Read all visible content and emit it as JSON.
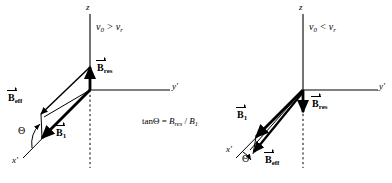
{
  "figure": {
    "background": "#ffffff",
    "stroke_color": "#000000"
  },
  "panels": [
    {
      "id": "left",
      "condition": "ν0 > νr",
      "condition_parts": {
        "nu": "ν",
        "sub0": "0",
        "relation": ">",
        "nu2": "ν",
        "subr": "r"
      },
      "axes": [
        {
          "name": "z-axis",
          "label": "z",
          "direction": "up"
        },
        {
          "name": "y-prime-axis",
          "label": "y'",
          "direction": "right"
        },
        {
          "name": "x-prime-axis",
          "label": "x'",
          "direction": "lower-left"
        }
      ],
      "vectors": [
        {
          "name": "B_res",
          "label": "B",
          "sub": "res",
          "direction": "up-along-z"
        },
        {
          "name": "B_1",
          "label": "B",
          "sub": "1",
          "direction": "lower-left-along-x-prime"
        },
        {
          "name": "B_eff",
          "label": "B",
          "sub": "eff",
          "direction": "left-resultant"
        }
      ],
      "angle": {
        "name": "theta-angle",
        "label": "Θ"
      }
    },
    {
      "id": "right",
      "condition": "ν0 < νr",
      "condition_parts": {
        "nu": "ν",
        "sub0": "0",
        "relation": "<",
        "nu2": "ν",
        "subr": "r"
      },
      "axes": [
        {
          "name": "z-axis",
          "label": "z",
          "direction": "up"
        },
        {
          "name": "y-prime-axis",
          "label": "y'",
          "direction": "right"
        },
        {
          "name": "x-prime-axis",
          "label": "x'",
          "direction": "lower-left"
        }
      ],
      "vectors": [
        {
          "name": "B_res",
          "label": "B",
          "sub": "res",
          "direction": "down-along-z"
        },
        {
          "name": "B_1",
          "label": "B",
          "sub": "1",
          "direction": "lower-left-along-x-prime"
        },
        {
          "name": "B_eff",
          "label": "B",
          "sub": "eff",
          "direction": "lower-left-resultant"
        }
      ],
      "angle": {
        "name": "theta-angle",
        "label": "Θ"
      }
    }
  ],
  "formula": {
    "text": "tanΘ = Bres / B1",
    "lhs": "tanΘ",
    "equals": "=",
    "numerator": "B",
    "numerator_sub": "res",
    "slash": "/",
    "denominator": "B",
    "denominator_sub": "1"
  }
}
